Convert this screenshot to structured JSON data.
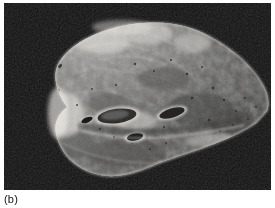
{
  "figure": {
    "caption": "(b)",
    "panel_label": "b",
    "media_type": "photograph",
    "rendering": "grayscale halftone print",
    "background_color": "#0a0a0a",
    "page_color": "#ffffff",
    "caption_color": "#131313"
  },
  "photo": {
    "frame": {
      "x": 4,
      "y": 3,
      "width": 267,
      "height": 187
    },
    "palette": {
      "background_dark": "#090909",
      "background_mottle": "#151515",
      "tissue_mid": "#8d8d8d",
      "tissue_light": "#cfcfcf",
      "tissue_highlight": "#eceae6",
      "tissue_dark": "#4a4a4a",
      "lumen_black": "#101010",
      "edge_rim": "#e4e2de"
    },
    "specimen": {
      "name": "lung-cut-surface",
      "outline_description": "broad wedge with a rounded apex upper-left-of-centre, a sweeping convex right border tapering to a point at the right edge, and an irregular undulating inferior border",
      "regions": [
        {
          "name": "apex",
          "note": "bright dome at upper left-centre"
        },
        {
          "name": "costal-surface",
          "note": "mottled mid-grey parenchyma across the upper two thirds"
        },
        {
          "name": "hilum",
          "note": "central cluster of dark elliptical bronchial and vascular lumina"
        },
        {
          "name": "basal-border",
          "note": "undulating lower margin with a bright rim"
        },
        {
          "name": "posterior-tip",
          "note": "narrow tapering point at the right margin"
        }
      ],
      "lumina_count": 7
    }
  }
}
